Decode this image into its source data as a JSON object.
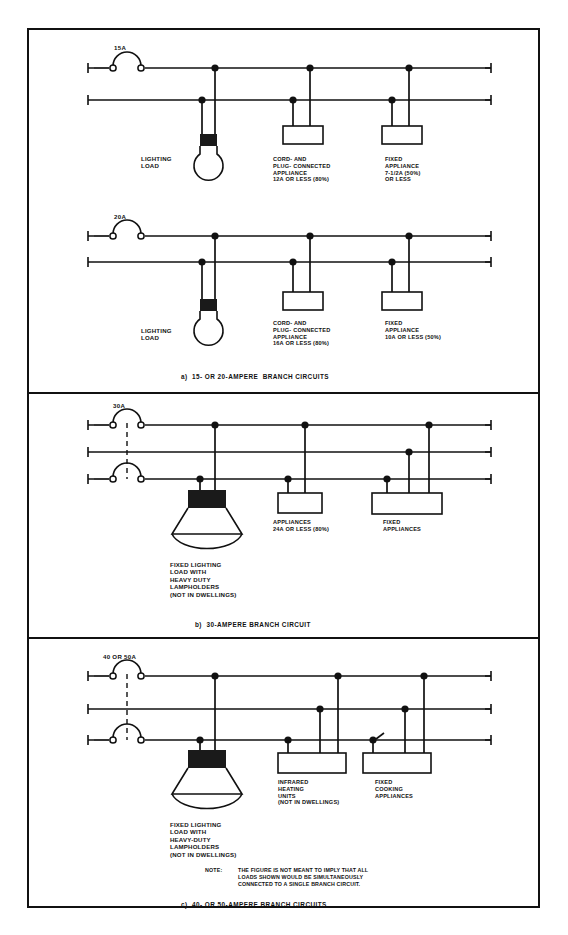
{
  "figure": {
    "note_label": "NOTE:",
    "note_text": "THE FIGURE IS NOT MEANT TO IMPLY THAT ALL\nLOADS SHOWN WOULD BE SIMULTANEOUSLY\nCONNECTED TO A SINGLE BRANCH CIRCUIT."
  },
  "sections": {
    "a": {
      "caption": "a)  15- OR 20-AMPERE  BRANCH CIRCUITS",
      "circuit1": {
        "breaker_rating": "15A",
        "lighting_label": "LIGHTING\nLOAD",
        "load1_label": "CORD- AND\nPLUG- CONNECTED\nAPPLIANCE\n12A OR LESS (80%)",
        "load2_label": "FIXED\nAPPLIANCE\n7-1/2A (50%)\nOR LESS"
      },
      "circuit2": {
        "breaker_rating": "20A",
        "lighting_label": "LIGHTING\nLOAD",
        "load1_label": "CORD- AND\nPLUG- CONNECTED\nAPPLIANCE\n16A OR LESS (80%)",
        "load2_label": "FIXED\nAPPLIANCE\n10A OR LESS (50%)"
      }
    },
    "b": {
      "caption": "b)  30-AMPERE BRANCH CIRCUIT",
      "breaker_rating": "30A",
      "lighting_label": "FIXED LIGHTING\nLOAD WITH\nHEAVY DUTY\nLAMPHOLDERS\n(NOT IN DWELLINGS)",
      "load1_label": "APPLIANCES\n24A OR LESS (80%)",
      "load2_label": "FIXED\nAPPLIANCES"
    },
    "c": {
      "caption": "c)  40- OR 50-AMPERE BRANCH CIRCUITS",
      "breaker_rating": "40 OR 50A",
      "lighting_label": "FIXED LIGHTING\nLOAD WITH\nHEAVY-DUTY\nLAMPHOLDERS\n(NOT IN DWELLINGS)",
      "load1_label": "INFRARED\nHEATING\nUNITS\n(NOT IN DWELLINGS)",
      "load2_label": "FIXED\nCOOKING\nAPPLIANCES"
    }
  },
  "colors": {
    "line": "#111111",
    "fill_black": "#1a1a1a",
    "background": "#ffffff"
  }
}
